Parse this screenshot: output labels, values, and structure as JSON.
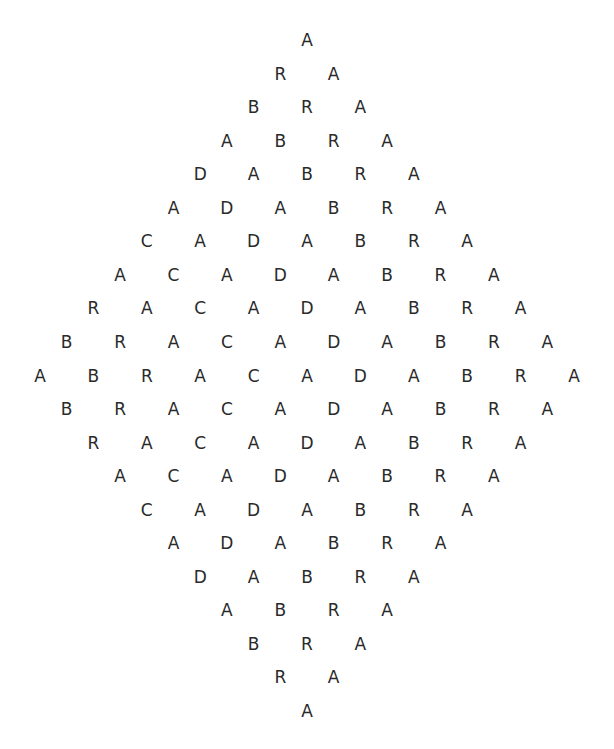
{
  "word": "ABRACADABRA",
  "rows": [
    [
      "A"
    ],
    [
      "R",
      "A"
    ],
    [
      "B",
      "R",
      "A"
    ],
    [
      "A",
      "B",
      "R",
      "A"
    ],
    [
      "D",
      "A",
      "B",
      "R",
      "A"
    ],
    [
      "A",
      "D",
      "A",
      "B",
      "R",
      "A"
    ],
    [
      "C",
      "A",
      "D",
      "A",
      "B",
      "R",
      "A"
    ],
    [
      "A",
      "C",
      "A",
      "D",
      "A",
      "B",
      "R",
      "A"
    ],
    [
      "R",
      "A",
      "C",
      "A",
      "D",
      "A",
      "B",
      "R",
      "A"
    ],
    [
      "B",
      "R",
      "A",
      "C",
      "A",
      "D",
      "A",
      "B",
      "R",
      "A"
    ],
    [
      "A",
      "B",
      "R",
      "A",
      "C",
      "A",
      "D",
      "A",
      "B",
      "R",
      "A"
    ],
    [
      "B",
      "R",
      "A",
      "C",
      "A",
      "D",
      "A",
      "B",
      "R",
      "A"
    ],
    [
      "R",
      "A",
      "C",
      "A",
      "D",
      "A",
      "B",
      "R",
      "A"
    ],
    [
      "A",
      "C",
      "A",
      "D",
      "A",
      "B",
      "R",
      "A"
    ],
    [
      "C",
      "A",
      "D",
      "A",
      "B",
      "R",
      "A"
    ],
    [
      "A",
      "D",
      "A",
      "B",
      "R",
      "A"
    ],
    [
      "D",
      "A",
      "B",
      "R",
      "A"
    ],
    [
      "A",
      "B",
      "R",
      "A"
    ],
    [
      "B",
      "R",
      "A"
    ],
    [
      "R",
      "A"
    ],
    [
      "A"
    ]
  ],
  "colors": {
    "text": "#2a2a2a",
    "background": "#ffffff"
  }
}
